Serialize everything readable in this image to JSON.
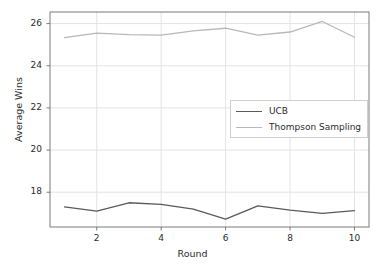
{
  "chart_data": {
    "type": "line",
    "title": "",
    "xlabel": "Round",
    "ylabel": "Average Wins",
    "x": [
      1,
      2,
      3,
      4,
      5,
      6,
      7,
      8,
      9,
      10
    ],
    "xlim": [
      0.55,
      10.45
    ],
    "ylim": [
      16.35,
      26.55
    ],
    "xticks": [
      2,
      4,
      6,
      8,
      10
    ],
    "xticklabels": [
      "2",
      "4",
      "6",
      "8",
      "10"
    ],
    "yticks": [
      18,
      20,
      22,
      24,
      26
    ],
    "yticklabels": [
      "18",
      "20",
      "22",
      "24",
      "26"
    ],
    "grid": true,
    "legend_position": "center-right",
    "series": [
      {
        "name": "UCB",
        "color": "#5a5a5a",
        "values": [
          17.3,
          17.1,
          17.5,
          17.42,
          17.2,
          16.72,
          17.35,
          17.15,
          17.0,
          17.13
        ]
      },
      {
        "name": "Thompson Sampling",
        "color": "#b8b8b8",
        "values": [
          25.33,
          25.55,
          25.48,
          25.45,
          25.65,
          25.78,
          25.45,
          25.6,
          26.1,
          25.35
        ]
      }
    ]
  },
  "legend": {
    "entries": [
      {
        "label": "UCB"
      },
      {
        "label": "Thompson Sampling"
      }
    ]
  },
  "axes": {
    "x_label": "Round",
    "y_label": "Average Wins"
  },
  "colors": {
    "ucb": "#5a5a5a",
    "thompson": "#b8b8b8",
    "grid": "#e3e3e3",
    "spine": "#7a7a7a",
    "text": "#2b2b2b",
    "background": "#ffffff"
  }
}
